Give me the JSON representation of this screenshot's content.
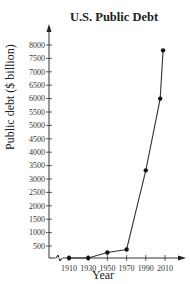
{
  "chart_data": {
    "type": "line",
    "title": "U.S. Public Debt",
    "xlabel": "Year",
    "ylabel": "Public debt ($ billion)",
    "x_ticks": [
      1910,
      1930,
      1950,
      1970,
      1990,
      2010
    ],
    "y_ticks": [
      500,
      1000,
      1500,
      2000,
      2500,
      3000,
      3500,
      4000,
      4500,
      5000,
      5500,
      6000,
      6500,
      7000,
      7500,
      8000
    ],
    "xlim": [
      1900,
      2020
    ],
    "ylim": [
      0,
      8400
    ],
    "grid": false,
    "legend": null,
    "axis_break_on_x": true,
    "series": [
      {
        "name": "U.S. Public Debt",
        "x": [
          1910,
          1930,
          1950,
          1970,
          1990,
          2005,
          2008
        ],
        "y": [
          1,
          16,
          257,
          371,
          3323,
          6000,
          7800
        ]
      }
    ]
  }
}
